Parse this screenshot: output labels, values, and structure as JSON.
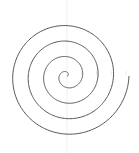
{
  "chart_data": {
    "type": "line",
    "projection": "polar",
    "title": "",
    "series": [
      {
        "name": "spiral",
        "equation": "r = theta",
        "theta_range_turns": [
          0,
          4
        ],
        "color": "#555555"
      }
    ],
    "r_ticks": [
      "",
      "",
      "",
      ""
    ],
    "grid": true,
    "gridline_color": "#e6e6e6"
  }
}
